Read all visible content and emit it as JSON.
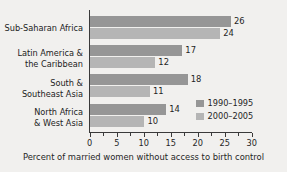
{
  "chart_data": {
    "type": "bar",
    "orientation": "horizontal",
    "title": "",
    "xlabel": "Percent of married women without access to birth control",
    "ylabel": "",
    "xlim": [
      0,
      30
    ],
    "xticks": [
      0,
      5,
      10,
      15,
      20,
      25,
      30
    ],
    "xtick_labels": [
      "0",
      "5",
      "10",
      "15",
      "20",
      "25",
      "30"
    ],
    "minor_tick_step": 2.5,
    "grid": false,
    "legend_position": "inside-right",
    "categories": [
      "Sub-Saharan Africa",
      "Latin America & the Caribbean",
      "South & Southeast Asia",
      "North Africa & West Asia"
    ],
    "category_lines": [
      [
        "Sub-Saharan Africa",
        ""
      ],
      [
        "Latin America &",
        "the Caribbean"
      ],
      [
        "South &",
        "Southeast Asia"
      ],
      [
        "North Africa",
        "& West Asia"
      ]
    ],
    "series": [
      {
        "name": "1990–1995",
        "color": "#969696",
        "values": [
          26,
          17,
          18,
          14
        ]
      },
      {
        "name": "2000–2005",
        "color": "#b5b5b5",
        "values": [
          24,
          12,
          11,
          10
        ]
      }
    ]
  },
  "legend": {
    "items": [
      {
        "label": "1990–1995"
      },
      {
        "label": "2000–2005"
      }
    ]
  },
  "axis": {
    "title": "Percent of married women without access to birth control"
  },
  "colors": {
    "background": "#f1f0ee",
    "series_1990": "#969696",
    "series_2000": "#b5b5b5",
    "axis": "#3a3a3a",
    "text": "#1f1f1f"
  }
}
